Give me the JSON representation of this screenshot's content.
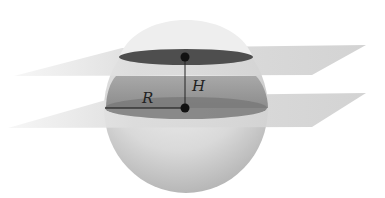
{
  "diagram": {
    "type": "sphere cut by two parallel planes (spherical segment / zone)",
    "labels": {
      "radius": "R",
      "height": "H"
    },
    "elements": [
      "sphere",
      "upper-plane",
      "lower-plane",
      "upper-circle-section",
      "lower-circle-section",
      "height-segment",
      "radius-segment",
      "upper-center-point",
      "lower-center-point"
    ],
    "colors": {
      "sphere_light": "#ededed",
      "sphere_dark": "#bdbdbd",
      "plane": "#d6d6d6",
      "section_dark": "#5a5a5a",
      "band": "#9a9a9a",
      "point": "#111111"
    }
  }
}
